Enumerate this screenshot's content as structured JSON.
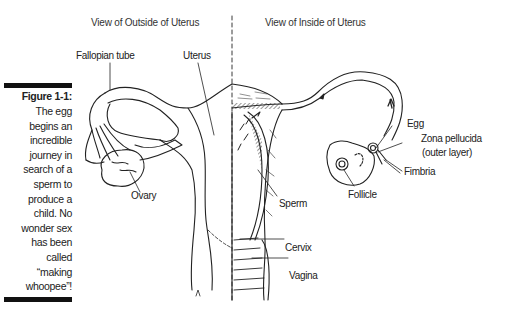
{
  "figure": {
    "title": "Figure 1-1:",
    "caption_lines": [
      "The egg",
      "begins an",
      "incredible",
      "journey in",
      "search of a",
      "sperm to",
      "produce a",
      "child. No",
      "wonder sex",
      "has been",
      "called",
      "“making",
      "whoopee”!"
    ]
  },
  "headings": {
    "outside": "View of Outside of Uterus",
    "inside": "View of Inside of Uterus"
  },
  "labels": {
    "fallopian_tube": "Fallopian tube",
    "uterus": "Uterus",
    "ovary": "Ovary",
    "egg": "Egg",
    "zona_pellucida_1": "Zona pellucida",
    "zona_pellucida_2": "(outer layer)",
    "fimbria": "Fimbria",
    "follicle": "Follicle",
    "sperm": "Sperm",
    "cervix": "Cervix",
    "vagina": "Vagina"
  }
}
